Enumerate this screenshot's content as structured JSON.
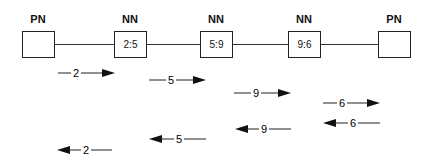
{
  "diagram": {
    "nodes": [
      {
        "type": "PN",
        "value": "",
        "x": 22
      },
      {
        "type": "NN",
        "value": "2:5",
        "x": 114
      },
      {
        "type": "NN",
        "value": "5:9",
        "x": 200
      },
      {
        "type": "NN",
        "value": "9:6",
        "x": 288
      },
      {
        "type": "PN",
        "value": "",
        "x": 378
      }
    ],
    "forward_arrows": [
      {
        "label": "2",
        "x1": 58,
        "x2": 115,
        "y": 73
      },
      {
        "label": "5",
        "x1": 149,
        "x2": 206,
        "y": 80
      },
      {
        "label": "9",
        "x1": 234,
        "x2": 291,
        "y": 93
      },
      {
        "label": "6",
        "x1": 323,
        "x2": 380,
        "y": 103
      }
    ],
    "backward_arrows": [
      {
        "label": "6",
        "x1": 323,
        "x2": 380,
        "y": 123
      },
      {
        "label": "9",
        "x1": 235,
        "x2": 291,
        "y": 129
      },
      {
        "label": "5",
        "x1": 149,
        "x2": 206,
        "y": 139
      },
      {
        "label": "2",
        "x1": 57,
        "x2": 112,
        "y": 150
      }
    ]
  }
}
